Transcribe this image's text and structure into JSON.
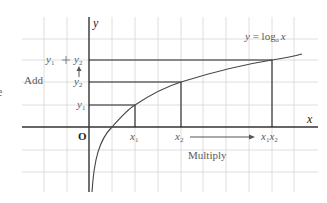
{
  "diagram": {
    "equation": {
      "y": "y",
      "eq": " = ",
      "log": "log",
      "base": "a",
      "x": "x"
    },
    "axes": {
      "x_label": "x",
      "y_label": "y",
      "origin_label": "O"
    },
    "y_labels": {
      "y1": {
        "base": "y",
        "sub": "1"
      },
      "y2": {
        "base": "y",
        "sub": "2"
      },
      "sum": {
        "a": "y",
        "a_sub": "1",
        "plus": " + ",
        "b": "y",
        "b_sub": "2"
      }
    },
    "x_labels": {
      "x1": {
        "base": "x",
        "sub": "1"
      },
      "x2": {
        "base": "x",
        "sub": "2"
      },
      "prod": {
        "a": "x",
        "a_sub": "1",
        "b": "x",
        "b_sub": "2"
      }
    },
    "annotations": {
      "add": "Add",
      "multiply": "Multiply"
    },
    "edge_glyph": "e",
    "colors": {
      "grid": "#d4d4d4",
      "axis": "#333333",
      "curve": "#444444",
      "guides": "#222222",
      "text": "#5a5a5a"
    }
  }
}
